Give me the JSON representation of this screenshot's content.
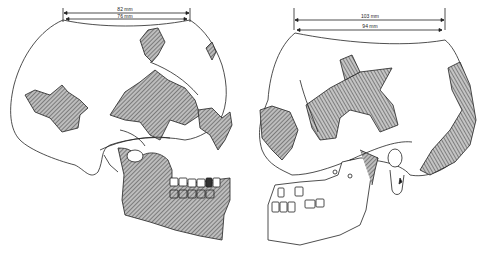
{
  "figure": {
    "type": "anatomical illustration",
    "left_skull": {
      "view": "right lateral",
      "measurements": [
        {
          "id": "outer",
          "label": "82 mm"
        },
        {
          "id": "inner",
          "label": "76 mm"
        }
      ]
    },
    "right_skull": {
      "view": "left lateral",
      "measurements": [
        {
          "id": "outer",
          "label": "103 mm"
        },
        {
          "id": "inner",
          "label": "94 mm"
        }
      ]
    },
    "colors": {
      "line": "#222222",
      "hatch": "#555555",
      "background": "#ffffff"
    }
  }
}
